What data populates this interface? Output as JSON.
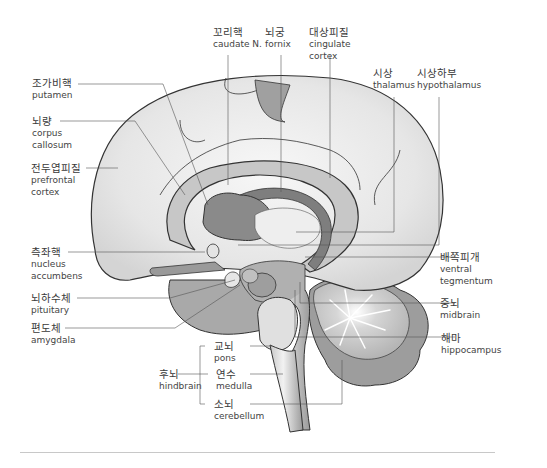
{
  "figure": {
    "type": "sagittal brain anatomy illustration",
    "colors": {
      "outline": "#333333",
      "cortex_fill": "#e8e8e8",
      "mid_gray": "#a8a8a8",
      "dark_gray": "#7a7a7a",
      "leader_line": "#555555",
      "divider": "#c8c8c8"
    }
  },
  "labels": {
    "caudate": {
      "ko": "꼬리핵",
      "en": "caudate N."
    },
    "fornix": {
      "ko": "뇌궁",
      "en": "fornix"
    },
    "cingulate": {
      "ko": "대상피질",
      "en1": "cingulate",
      "en2": "cortex"
    },
    "thalamus": {
      "ko": "시상",
      "en": "thalamus"
    },
    "hypothalamus": {
      "ko": "시상하부",
      "en": "hypothalamus"
    },
    "putamen": {
      "ko": "조가비핵",
      "en": "putamen"
    },
    "corpus": {
      "ko": "뇌량",
      "en1": "corpus",
      "en2": "callosum"
    },
    "prefrontal": {
      "ko": "전두엽피질",
      "en1": "prefrontal",
      "en2": "cortex"
    },
    "accumbens": {
      "ko": "측좌핵",
      "en1": "nucleus",
      "en2": "accumbens"
    },
    "pituitary": {
      "ko": "뇌하수체",
      "en": "pituitary"
    },
    "amygdala": {
      "ko": "편도체",
      "en": "amygdala"
    },
    "ventral": {
      "ko": "배쪽피개",
      "en1": "ventral",
      "en2": "tegmentum"
    },
    "midbrain": {
      "ko": "중뇌",
      "en": "midbrain"
    },
    "hippocampus": {
      "ko": "해마",
      "en": "hippocampus"
    },
    "pons": {
      "ko": "교뇌",
      "en": "pons"
    },
    "medulla": {
      "ko": "연수",
      "en": "medulla"
    },
    "cerebellum": {
      "ko": "소뇌",
      "en": "cerebellum"
    },
    "hindbrain": {
      "ko": "후뇌",
      "en": "hindbrain"
    }
  }
}
